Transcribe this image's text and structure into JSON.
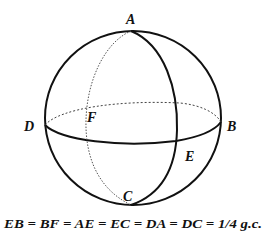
{
  "diagram": {
    "points": {
      "A": "A",
      "B": "B",
      "C": "C",
      "D": "D",
      "E": "E",
      "F": "F"
    },
    "caption": "EB = BF = AE = EC = DA = DC = 1/4 g.c.",
    "colors": {
      "stroke": "#111111",
      "background": "#ffffff"
    }
  }
}
